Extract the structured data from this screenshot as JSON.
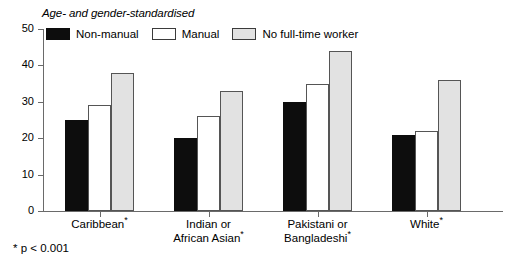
{
  "chart_data": {
    "type": "bar",
    "title": "Age- and gender-standardised",
    "xlabel": "",
    "ylabel": "",
    "ylim": [
      0,
      50
    ],
    "yticks": [
      0,
      10,
      20,
      30,
      40,
      50
    ],
    "grid": false,
    "legend_position": "top-left",
    "categories": [
      "Caribbean*",
      "Indian or\nAfrican Asian*",
      "Pakistani or\nBangladeshi*",
      "White*"
    ],
    "series": [
      {
        "name": "Non-manual",
        "color": "#0d0d0d",
        "values": [
          25,
          20,
          30,
          21
        ]
      },
      {
        "name": "Manual",
        "color": "#ffffff",
        "values": [
          29,
          26,
          35,
          22
        ]
      },
      {
        "name": "No full-time worker",
        "color": "#e2e2e2",
        "values": [
          38,
          33,
          44,
          36
        ]
      }
    ],
    "annotations": [
      "* p < 0.001"
    ]
  },
  "footnote": "* p < 0.001"
}
